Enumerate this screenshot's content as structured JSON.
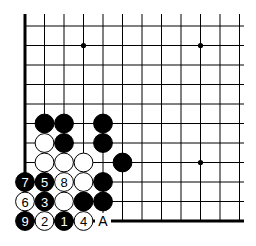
{
  "board": {
    "origin_x": 25,
    "origin_y": 26,
    "spacing": 19.5,
    "cols": 12,
    "rows": 11,
    "hoshi": [
      [
        3,
        1
      ],
      [
        9,
        1
      ],
      [
        9,
        7
      ]
    ],
    "stones": [
      {
        "c": 1,
        "r": 5,
        "color": "black",
        "label": ""
      },
      {
        "c": 2,
        "r": 5,
        "color": "black",
        "label": ""
      },
      {
        "c": 4,
        "r": 5,
        "color": "black",
        "label": ""
      },
      {
        "c": 1,
        "r": 6,
        "color": "white",
        "label": ""
      },
      {
        "c": 2,
        "r": 6,
        "color": "black",
        "label": ""
      },
      {
        "c": 4,
        "r": 6,
        "color": "black",
        "label": ""
      },
      {
        "c": 1,
        "r": 7,
        "color": "white",
        "label": ""
      },
      {
        "c": 2,
        "r": 7,
        "color": "white",
        "label": ""
      },
      {
        "c": 3,
        "r": 7,
        "color": "white",
        "label": ""
      },
      {
        "c": 5,
        "r": 7,
        "color": "black",
        "label": ""
      },
      {
        "c": 0,
        "r": 8,
        "color": "black",
        "label": "7"
      },
      {
        "c": 1,
        "r": 8,
        "color": "black",
        "label": "5"
      },
      {
        "c": 2,
        "r": 8,
        "color": "white",
        "label": "8"
      },
      {
        "c": 3,
        "r": 8,
        "color": "white",
        "label": ""
      },
      {
        "c": 4,
        "r": 8,
        "color": "black",
        "label": ""
      },
      {
        "c": 0,
        "r": 9,
        "color": "white",
        "label": "6"
      },
      {
        "c": 1,
        "r": 9,
        "color": "black",
        "label": "3"
      },
      {
        "c": 2,
        "r": 9,
        "color": "white",
        "label": ""
      },
      {
        "c": 3,
        "r": 9,
        "color": "black",
        "label": ""
      },
      {
        "c": 4,
        "r": 9,
        "color": "black",
        "label": ""
      },
      {
        "c": 0,
        "r": 10,
        "color": "black",
        "label": "9"
      },
      {
        "c": 1,
        "r": 10,
        "color": "white",
        "label": "2"
      },
      {
        "c": 2,
        "r": 10,
        "color": "black",
        "label": "1"
      },
      {
        "c": 3,
        "r": 10,
        "color": "white",
        "label": "4"
      }
    ],
    "marks": [
      {
        "c": 4,
        "r": 10,
        "label": "A"
      }
    ]
  }
}
